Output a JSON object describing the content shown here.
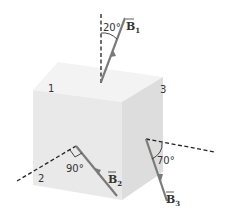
{
  "diagram": {
    "type": "cube-with-magnetic-field-vectors",
    "faces": [
      {
        "label": "1"
      },
      {
        "label": "2"
      },
      {
        "label": "3"
      }
    ],
    "vectors": [
      {
        "symbol": "B",
        "subscript": "1",
        "angle_label": "20°"
      },
      {
        "symbol": "B",
        "subscript": "2",
        "angle_label": "90°"
      },
      {
        "symbol": "B",
        "subscript": "3",
        "angle_label": "70°"
      }
    ],
    "colors": {
      "cube_top": "#f2f2f2",
      "cube_front": "#e8e8e8",
      "cube_right": "#dedede",
      "vector": "#777777",
      "dashed": "#222222"
    }
  }
}
